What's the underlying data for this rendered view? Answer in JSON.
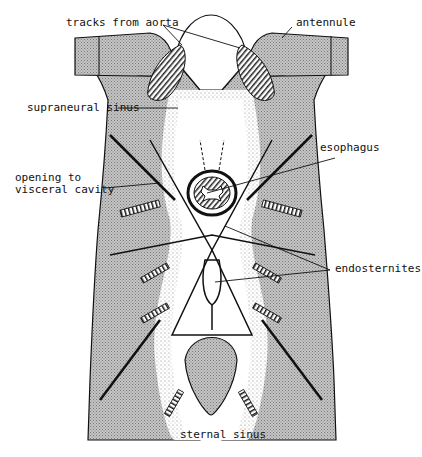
{
  "figure": {
    "type": "anatomical-illustration",
    "colors": {
      "ink": "#111111",
      "shade": "#b8b8b8",
      "background": "#ffffff"
    }
  },
  "labels": {
    "tracks_from_aorta": "tracks from aorta",
    "antennule": "antennule",
    "supraneural_sinus": "supraneural sinus",
    "esophagus": "esophagus",
    "opening_to_visceral_cavity": "opening to\nvisceral cavity",
    "endosternites": "endosternites",
    "sternal_sinus": "sternal sinus"
  }
}
